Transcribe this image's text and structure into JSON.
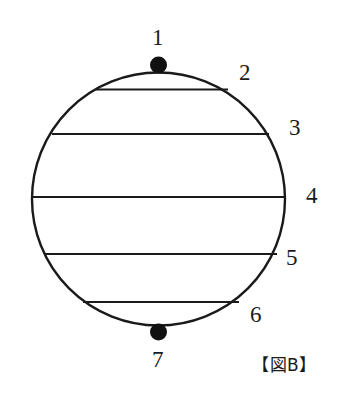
{
  "figure": {
    "caption": "【図B】",
    "background_color": "#ffffff",
    "stroke_color": "#1a1a1a",
    "dot_color": "#111111",
    "circle": {
      "center_x": 158.5,
      "center_y": 199,
      "radius": 126.5,
      "stroke_width": 2.4
    },
    "points": [
      {
        "id": "p1",
        "label": "1",
        "x": 158.5,
        "y": 65,
        "marker": "filled-dot",
        "radius": 8.5
      },
      {
        "id": "p7",
        "label": "7",
        "x": 158.5,
        "y": 332,
        "marker": "filled-dot",
        "radius": 8.5
      }
    ],
    "chords": [
      {
        "id": "chord-2",
        "label": "2",
        "y": 89.5,
        "x1": 96,
        "x2": 228
      },
      {
        "id": "chord-3",
        "label": "3",
        "y": 134,
        "x1": 52,
        "x2": 269
      },
      {
        "id": "chord-4",
        "label": "4",
        "y": 197,
        "x1": 32,
        "x2": 285
      },
      {
        "id": "chord-5",
        "label": "5",
        "y": 254,
        "x1": 44,
        "x2": 277
      },
      {
        "id": "chord-6",
        "label": "6",
        "y": 302,
        "x1": 83,
        "x2": 239
      }
    ],
    "labels": [
      {
        "id": "label-1",
        "text": "1"
      },
      {
        "id": "label-2",
        "text": "2"
      },
      {
        "id": "label-3",
        "text": "3"
      },
      {
        "id": "label-4",
        "text": "4"
      },
      {
        "id": "label-5",
        "text": "5"
      },
      {
        "id": "label-6",
        "text": "6"
      },
      {
        "id": "label-7",
        "text": "7"
      }
    ]
  }
}
